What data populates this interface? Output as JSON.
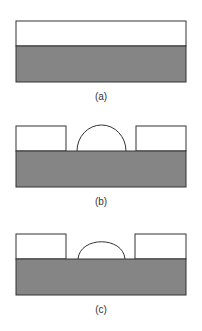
{
  "figure": {
    "panels": [
      {
        "id": "a",
        "label": "(a)",
        "description": "flat layer on substrate"
      },
      {
        "id": "b",
        "label": "(b)",
        "description": "patterned layer with hemispherical bump"
      },
      {
        "id": "c",
        "label": "(c)",
        "description": "patterned layer with flattened bump"
      }
    ],
    "colors": {
      "substrate": "#858585",
      "layer": "#ffffff",
      "outline": "#333333"
    }
  }
}
